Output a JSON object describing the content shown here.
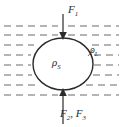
{
  "figure": {
    "name": "buoyancy-free-body-diagram",
    "width": 122,
    "height": 127,
    "background": "#ffffff",
    "stroke_color": "#2b2b2b",
    "fluid_line_color": "#6b6b6b"
  },
  "labels": {
    "force_top": {
      "symbol": "F",
      "subscript": "1",
      "full": "F1"
    },
    "force_bottom": {
      "symbol_a": "F",
      "subscript_a": "2",
      "separator": ", ",
      "symbol_b": "F",
      "subscript_b": "3",
      "full": "F2, F3"
    },
    "density_solid": {
      "symbol": "ρ",
      "subscript": "S",
      "full": "ρS"
    },
    "density_liquid": {
      "symbol": "ρ",
      "subscript": "L",
      "full": "ρL"
    }
  },
  "geometry": {
    "sphere": {
      "center_x": 63,
      "center_y": 64,
      "radius_x": 30,
      "radius_y": 26
    },
    "arrow_top": {
      "x": 63,
      "y_start": 14,
      "y_end": 38,
      "direction": "down"
    },
    "arrow_bottom": {
      "x": 63,
      "y_start": 124,
      "y_end": 90,
      "direction": "up"
    },
    "fluid_rows_y": [
      26,
      35,
      45,
      55,
      65,
      75,
      85,
      95
    ],
    "fluid_dash": "7 5"
  }
}
